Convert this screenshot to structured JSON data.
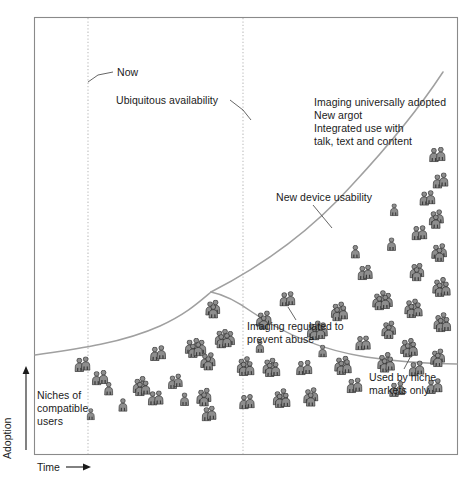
{
  "figure": {
    "type": "scenario-fork-diagram",
    "axes": {
      "y_label": "Adoption",
      "x_label": "Time",
      "y_arrow": "up-arrow",
      "x_arrow": "right-arrow",
      "ticks": [],
      "grid": "two vertical dotted reference lines"
    },
    "plot_frame": {
      "x": 34,
      "y": 17,
      "width": 424,
      "height": 438
    },
    "reference_lines": [
      {
        "name": "now-line",
        "x": 88,
        "style": "dotted"
      },
      {
        "name": "fork-line",
        "x": 243,
        "style": "dotted"
      }
    ],
    "annotations": [
      {
        "id": "now",
        "text": "Now",
        "x": 118,
        "y": 73,
        "leader": true
      },
      {
        "id": "ubiquitous-availability",
        "text": "Ubiquitous availability",
        "x": 118,
        "y": 100,
        "leader": true
      },
      {
        "id": "imaging-universally-adopted",
        "text": "Imaging universally adopted\nNew argot\nInterated use with\ntalk, text and content",
        "x": 315,
        "y": 99,
        "leader": false
      },
      {
        "id": "new-device-usability",
        "text": "New device usability",
        "x": 277,
        "y": 197,
        "leader": true
      },
      {
        "id": "imaging-regulated",
        "text": "Imaging regulated to\nprevent abuse",
        "x": 248,
        "y": 327,
        "leader": true
      },
      {
        "id": "used-by-niche-markets",
        "text": "Used by niche\nmarkets only",
        "x": 370,
        "y": 377,
        "leader": true
      },
      {
        "id": "niches-of-compatible-users",
        "text": "Niches of\ncompatible\nusers",
        "x": 38,
        "y": 394,
        "leader": false
      }
    ],
    "annotation_text": {
      "now": "Now",
      "ubiquitous_availability": "Ubiquitous availability",
      "upper_scenario_line1": "Imaging universally adopted",
      "upper_scenario_line2": "New argot",
      "upper_scenario_line3": "Integrated use with",
      "upper_scenario_line4": "talk, text and content",
      "new_device_usability": "New device usability",
      "imaging_regulated_line1": "Imaging regulated to",
      "imaging_regulated_line2": "prevent abuse",
      "used_by_niche_line1": "Used by niche",
      "used_by_niche_line2": "markets only",
      "niches_line1": "Niches of",
      "niches_line2": "compatible",
      "niches_line3": "users"
    },
    "colors": {
      "frame": "#8a8a8a",
      "curve": "#9d9d9d",
      "dotted": "#b9b9b9",
      "text": "#1b1b1b",
      "person_fill": "#8c8c8c",
      "person_stroke": "#3a3a3a",
      "background": "#ffffff"
    }
  },
  "chart_data": {
    "type": "area",
    "title": "",
    "xlabel": "Time",
    "ylabel": "Adoption",
    "grid": false,
    "legend_position": "none",
    "xlim": [
      0,
      100
    ],
    "ylim": [
      0,
      100
    ],
    "series": [
      {
        "name": "Shared trend (before fork)",
        "x": [
          0,
          12,
          25,
          37,
          50
        ],
        "y": [
          23,
          24,
          26,
          30,
          34
        ]
      },
      {
        "name": "Optimistic branch: imaging universally adopted",
        "x": [
          50,
          60,
          70,
          80,
          90,
          100
        ],
        "y": [
          34,
          40,
          50,
          63,
          78,
          95
        ]
      },
      {
        "name": "Pessimistic branch: used by niche markets only",
        "x": [
          50,
          60,
          70,
          80,
          90,
          100
        ],
        "y": [
          34,
          34,
          31,
          27,
          24,
          22
        ]
      }
    ],
    "reference_lines": [
      {
        "label": "Now",
        "x": 13
      },
      {
        "label": "Fork",
        "x": 50
      }
    ],
    "annotations": [
      "Now",
      "Ubiquitous availability",
      "Imaging universally adopted",
      "New argot",
      "Integrated use with talk, text and content",
      "New device usability",
      "Imaging regulated to prevent abuse",
      "Used by niche markets only",
      "Niches of compatible users"
    ]
  },
  "person_clusters": [
    {
      "x": 74,
      "y": 356,
      "count": 2,
      "scale": 1.0
    },
    {
      "x": 92,
      "y": 370,
      "count": 2,
      "scale": 1.0
    },
    {
      "x": 104,
      "y": 382,
      "count": 1,
      "scale": 0.95
    },
    {
      "x": 118,
      "y": 398,
      "count": 1,
      "scale": 0.95
    },
    {
      "x": 132,
      "y": 376,
      "count": 4,
      "scale": 1.0
    },
    {
      "x": 148,
      "y": 390,
      "count": 2,
      "scale": 1.0
    },
    {
      "x": 150,
      "y": 345,
      "count": 2,
      "scale": 1.0
    },
    {
      "x": 168,
      "y": 374,
      "count": 2,
      "scale": 0.95
    },
    {
      "x": 185,
      "y": 337,
      "count": 5,
      "scale": 1.0
    },
    {
      "x": 200,
      "y": 351,
      "count": 3,
      "scale": 1.0
    },
    {
      "x": 180,
      "y": 392,
      "count": 1,
      "scale": 0.95
    },
    {
      "x": 196,
      "y": 387,
      "count": 3,
      "scale": 1.0
    },
    {
      "x": 214,
      "y": 328,
      "count": 5,
      "scale": 1.0
    },
    {
      "x": 201,
      "y": 406,
      "count": 2,
      "scale": 1.0
    },
    {
      "x": 236,
      "y": 356,
      "count": 4,
      "scale": 1.0
    },
    {
      "x": 239,
      "y": 394,
      "count": 2,
      "scale": 1.0
    },
    {
      "x": 205,
      "y": 299,
      "count": 3,
      "scale": 1.0
    },
    {
      "x": 256,
      "y": 310,
      "count": 3,
      "scale": 1.0
    },
    {
      "x": 279,
      "y": 291,
      "count": 2,
      "scale": 1.0
    },
    {
      "x": 262,
      "y": 357,
      "count": 4,
      "scale": 1.0
    },
    {
      "x": 272,
      "y": 388,
      "count": 4,
      "scale": 1.0
    },
    {
      "x": 296,
      "y": 360,
      "count": 2,
      "scale": 1.0
    },
    {
      "x": 303,
      "y": 387,
      "count": 3,
      "scale": 1.0
    },
    {
      "x": 307,
      "y": 320,
      "count": 5,
      "scale": 1.0
    },
    {
      "x": 330,
      "y": 301,
      "count": 4,
      "scale": 1.0
    },
    {
      "x": 334,
      "y": 355,
      "count": 4,
      "scale": 1.0
    },
    {
      "x": 346,
      "y": 378,
      "count": 2,
      "scale": 1.0
    },
    {
      "x": 355,
      "y": 335,
      "count": 2,
      "scale": 1.0
    },
    {
      "x": 357,
      "y": 265,
      "count": 2,
      "scale": 1.0
    },
    {
      "x": 372,
      "y": 290,
      "count": 5,
      "scale": 1.0
    },
    {
      "x": 381,
      "y": 320,
      "count": 3,
      "scale": 1.0
    },
    {
      "x": 377,
      "y": 352,
      "count": 4,
      "scale": 1.0
    },
    {
      "x": 389,
      "y": 381,
      "count": 2,
      "scale": 1.0
    },
    {
      "x": 400,
      "y": 337,
      "count": 4,
      "scale": 1.0
    },
    {
      "x": 404,
      "y": 298,
      "count": 4,
      "scale": 1.0
    },
    {
      "x": 409,
      "y": 262,
      "count": 3,
      "scale": 1.0
    },
    {
      "x": 411,
      "y": 225,
      "count": 2,
      "scale": 1.0
    },
    {
      "x": 419,
      "y": 190,
      "count": 2,
      "scale": 1.0
    },
    {
      "x": 429,
      "y": 147,
      "count": 2,
      "scale": 1.0
    },
    {
      "x": 432,
      "y": 173,
      "count": 2,
      "scale": 1.0
    },
    {
      "x": 428,
      "y": 209,
      "count": 3,
      "scale": 1.0
    },
    {
      "x": 431,
      "y": 242,
      "count": 3,
      "scale": 1.0
    },
    {
      "x": 432,
      "y": 277,
      "count": 4,
      "scale": 1.0
    },
    {
      "x": 433,
      "y": 312,
      "count": 4,
      "scale": 1.0
    },
    {
      "x": 430,
      "y": 348,
      "count": 3,
      "scale": 1.0
    },
    {
      "x": 426,
      "y": 378,
      "count": 2,
      "scale": 1.0
    },
    {
      "x": 408,
      "y": 361,
      "count": 2,
      "scale": 1.0
    },
    {
      "x": 351,
      "y": 245,
      "count": 1,
      "scale": 0.95
    },
    {
      "x": 387,
      "y": 237,
      "count": 1,
      "scale": 0.95
    },
    {
      "x": 390,
      "y": 203,
      "count": 1,
      "scale": 0.9
    },
    {
      "x": 318,
      "y": 345,
      "count": 1,
      "scale": 0.9
    },
    {
      "x": 255,
      "y": 340,
      "count": 1,
      "scale": 0.9
    },
    {
      "x": 86,
      "y": 408,
      "count": 1,
      "scale": 0.85
    }
  ]
}
